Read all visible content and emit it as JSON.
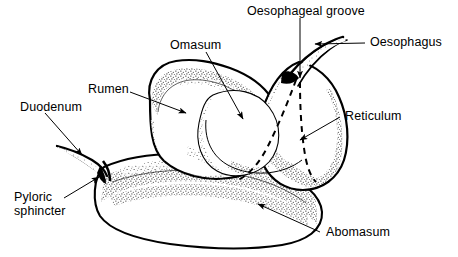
{
  "figure": {
    "background_color": "#ffffff",
    "ink_color": "#000000"
  },
  "labels": {
    "oesophageal_groove": "Oesophageal groove",
    "oesophagus": "Oesophagus",
    "omasum": "Omasum",
    "rumen": "Rumen",
    "duodenum": "Duodenum",
    "pyloric_sphincter": "Pyloric\nsphincter",
    "reticulum": "Reticulum",
    "abomasum": "Abomasum"
  },
  "structures": [
    {
      "name": "rumen",
      "kind": "organ-lobe",
      "position": "upper-left"
    },
    {
      "name": "omasum",
      "kind": "organ-lobe",
      "position": "center"
    },
    {
      "name": "reticulum",
      "kind": "organ-lobe",
      "position": "right"
    },
    {
      "name": "abomasum",
      "kind": "organ-sac",
      "position": "lower"
    },
    {
      "name": "oesophagus",
      "kind": "tube",
      "position": "top-right"
    },
    {
      "name": "duodenum",
      "kind": "tube",
      "position": "left"
    },
    {
      "name": "pyloric-sphincter",
      "kind": "junction",
      "position": "lower-left"
    },
    {
      "name": "oesophageal-groove",
      "kind": "dashed-channel",
      "position": "right-center"
    }
  ]
}
